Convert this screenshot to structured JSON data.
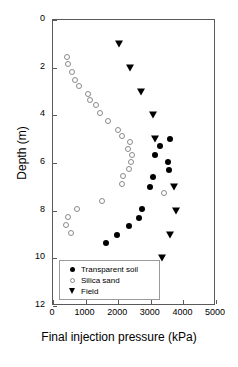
{
  "chart_data": {
    "type": "scatter",
    "title": "",
    "xlabel": "Final injection pressure (kPa)",
    "ylabel": "Depth (m)",
    "xlim": [
      0,
      5000
    ],
    "ylim": [
      0,
      12
    ],
    "y_inverted": true,
    "grid": false,
    "xticks": [
      "0",
      "1000",
      "2000",
      "3000",
      "4000",
      "5000"
    ],
    "xtick_values": [
      0,
      1000,
      2000,
      3000,
      4000,
      5000
    ],
    "yticks": [
      "0",
      "2",
      "4",
      "6",
      "8",
      "10",
      "12"
    ],
    "ytick_values": [
      0,
      2,
      4,
      6,
      8,
      10,
      12
    ],
    "legend_position": "lower-left-inside",
    "series": [
      {
        "name": "Transparent soil",
        "marker": "filled-circle",
        "color": "#000000",
        "points": [
          {
            "x": 3580,
            "y": 5.0
          },
          {
            "x": 3280,
            "y": 5.3
          },
          {
            "x": 3140,
            "y": 5.65
          },
          {
            "x": 3520,
            "y": 5.95
          },
          {
            "x": 3560,
            "y": 6.3
          },
          {
            "x": 3080,
            "y": 6.6
          },
          {
            "x": 2980,
            "y": 7.0
          },
          {
            "x": 2730,
            "y": 7.95
          },
          {
            "x": 2650,
            "y": 8.3
          },
          {
            "x": 2330,
            "y": 8.65
          },
          {
            "x": 1960,
            "y": 9.0
          },
          {
            "x": 1630,
            "y": 9.35
          }
        ]
      },
      {
        "name": "Silica sand",
        "marker": "open-circle",
        "color": "#8a8a8a",
        "points": [
          {
            "x": 430,
            "y": 1.55
          },
          {
            "x": 460,
            "y": 1.85
          },
          {
            "x": 590,
            "y": 2.2
          },
          {
            "x": 690,
            "y": 2.5
          },
          {
            "x": 800,
            "y": 2.75
          },
          {
            "x": 1060,
            "y": 3.1
          },
          {
            "x": 1130,
            "y": 3.35
          },
          {
            "x": 1330,
            "y": 3.55
          },
          {
            "x": 1430,
            "y": 3.9
          },
          {
            "x": 1700,
            "y": 4.25
          },
          {
            "x": 2000,
            "y": 4.6
          },
          {
            "x": 2130,
            "y": 4.85
          },
          {
            "x": 2350,
            "y": 5.1
          },
          {
            "x": 2300,
            "y": 5.4
          },
          {
            "x": 2420,
            "y": 5.65
          },
          {
            "x": 2380,
            "y": 5.95
          },
          {
            "x": 2330,
            "y": 6.25
          },
          {
            "x": 2150,
            "y": 6.55
          },
          {
            "x": 2130,
            "y": 6.9
          },
          {
            "x": 3400,
            "y": 7.25
          },
          {
            "x": 1500,
            "y": 7.6
          },
          {
            "x": 740,
            "y": 7.95
          },
          {
            "x": 470,
            "y": 8.25
          },
          {
            "x": 400,
            "y": 8.6
          },
          {
            "x": 560,
            "y": 8.95
          }
        ]
      },
      {
        "name": "Field",
        "marker": "filled-triangle-down",
        "color": "#000000",
        "points": [
          {
            "x": 2020,
            "y": 1.0
          },
          {
            "x": 2350,
            "y": 2.0
          },
          {
            "x": 2700,
            "y": 3.0
          },
          {
            "x": 3070,
            "y": 4.0
          },
          {
            "x": 3130,
            "y": 5.0
          },
          {
            "x": 3720,
            "y": 7.0
          },
          {
            "x": 3780,
            "y": 8.0
          },
          {
            "x": 3600,
            "y": 9.0
          },
          {
            "x": 3350,
            "y": 10.0
          }
        ]
      }
    ]
  },
  "legend": {
    "items": [
      {
        "label": "Transparent soil",
        "marker": "filled-circle"
      },
      {
        "label": "Silica sand",
        "marker": "open-circle"
      },
      {
        "label": "Field",
        "marker": "filled-triangle-down"
      }
    ]
  },
  "caption": {
    "text": ""
  }
}
